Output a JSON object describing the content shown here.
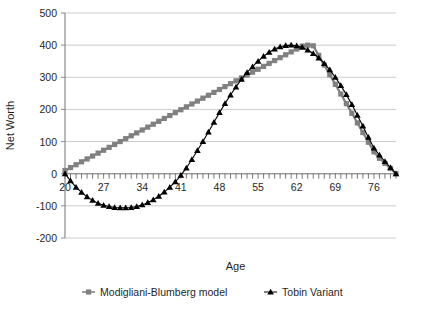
{
  "chart_data": {
    "type": "line",
    "title": "",
    "xlabel": "Age",
    "ylabel": "Net Worth",
    "xlim": [
      20,
      80
    ],
    "ylim": [
      -200,
      500
    ],
    "grid": true,
    "legend_position": "bottom",
    "x_tick_labels": [
      "20",
      "27",
      "34",
      "41",
      "48",
      "55",
      "62",
      "69",
      "76"
    ],
    "x_ticks": [
      20,
      27,
      34,
      41,
      48,
      55,
      62,
      69,
      76
    ],
    "x_minor_tick_interval": 1,
    "y_tick_labels": [
      "500",
      "400",
      "300",
      "200",
      "100",
      "0",
      "-100",
      "-200"
    ],
    "y_ticks": [
      500,
      400,
      300,
      200,
      100,
      0,
      -100,
      -200
    ],
    "x": [
      20,
      21,
      22,
      23,
      24,
      25,
      26,
      27,
      28,
      29,
      30,
      31,
      32,
      33,
      34,
      35,
      36,
      37,
      38,
      39,
      40,
      41,
      42,
      43,
      44,
      45,
      46,
      47,
      48,
      49,
      50,
      51,
      52,
      53,
      54,
      55,
      56,
      57,
      58,
      59,
      60,
      61,
      62,
      63,
      64,
      65,
      66,
      67,
      68,
      69,
      70,
      71,
      72,
      73,
      74,
      75,
      76,
      77,
      78,
      79,
      80
    ],
    "series": [
      {
        "name": "Modigliani-Blumberg model",
        "marker": "square",
        "color": "#808080",
        "values": [
          10,
          19,
          28,
          37,
          46,
          55,
          64,
          73,
          82,
          91,
          100,
          109,
          118,
          127,
          136,
          145,
          154,
          163,
          172,
          181,
          190,
          199,
          208,
          217,
          226,
          235,
          244,
          253,
          262,
          271,
          280,
          289,
          298,
          307,
          316,
          325,
          334,
          343,
          352,
          361,
          370,
          379,
          388,
          397,
          400,
          398,
          368,
          338,
          308,
          278,
          248,
          218,
          188,
          158,
          128,
          98,
          68,
          48,
          32,
          16,
          0
        ]
      },
      {
        "name": "Tobin Variant",
        "marker": "triangle",
        "color": "#000000",
        "values": [
          0,
          -22,
          -42,
          -58,
          -72,
          -83,
          -92,
          -98,
          -102,
          -105,
          -106,
          -106,
          -105,
          -102,
          -97,
          -90,
          -81,
          -70,
          -57,
          -42,
          -25,
          -5,
          18,
          44,
          72,
          100,
          130,
          160,
          190,
          218,
          245,
          270,
          294,
          315,
          333,
          350,
          365,
          378,
          388,
          395,
          399,
          400,
          398,
          393,
          385,
          374,
          360,
          343,
          323,
          300,
          274,
          246,
          215,
          182,
          148,
          113,
          80,
          58,
          38,
          19,
          0
        ]
      }
    ]
  },
  "legend": {
    "items": [
      {
        "label": "Modigliani-Blumberg model",
        "marker": "square",
        "color": "#808080"
      },
      {
        "label": "Tobin Variant",
        "marker": "triangle",
        "color": "#000000"
      }
    ]
  },
  "axes": {
    "y_title": "Net Worth",
    "x_title": "Age"
  }
}
